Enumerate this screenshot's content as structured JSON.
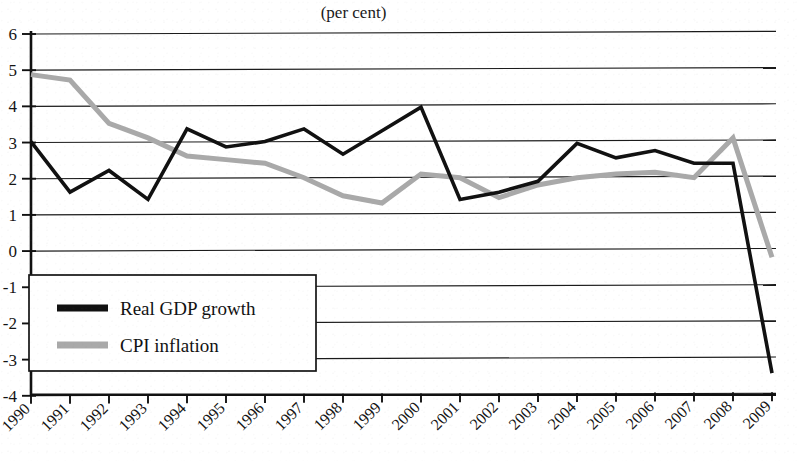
{
  "chart_data": {
    "type": "line",
    "title": "",
    "subtitle": "(per cent)",
    "xlabel": "",
    "ylabel": "",
    "unit": "per cent",
    "categories": [
      "1990",
      "1991",
      "1992",
      "1993",
      "1994",
      "1995",
      "1996",
      "1997",
      "1998",
      "1999",
      "2000",
      "2001",
      "2002",
      "2003",
      "2004",
      "2005",
      "2006",
      "2007",
      "2008",
      "2009"
    ],
    "x": [
      1990,
      1991,
      1992,
      1993,
      1994,
      1995,
      1996,
      1997,
      1998,
      1999,
      2000,
      2001,
      2002,
      2003,
      2004,
      2005,
      2006,
      2007,
      2008,
      2009
    ],
    "series": [
      {
        "name": "Real GDP growth",
        "color": "#111111",
        "values": [
          3.0,
          1.6,
          2.2,
          1.4,
          3.35,
          2.85,
          3.0,
          3.35,
          2.65,
          3.3,
          3.95,
          1.4,
          1.6,
          1.9,
          2.95,
          2.55,
          2.75,
          2.4,
          2.4,
          -3.4
        ]
      },
      {
        "name": "CPI inflation",
        "color": "#a9a9a9",
        "values": [
          4.85,
          4.7,
          3.5,
          3.1,
          2.6,
          2.5,
          2.4,
          2.0,
          1.5,
          1.3,
          2.1,
          2.0,
          1.45,
          1.8,
          2.0,
          2.1,
          2.15,
          2.0,
          3.1,
          -0.2
        ]
      }
    ],
    "ylim": [
      -4,
      6
    ],
    "ytick_step": 1,
    "ytick_labels": [
      "6",
      "5",
      "4",
      "3",
      "2",
      "1",
      "0",
      "-1",
      "-2",
      "-3",
      "-4"
    ],
    "ytick_values": [
      6,
      5,
      4,
      3,
      2,
      1,
      0,
      -1,
      -2,
      -3,
      -4
    ],
    "grid": true,
    "grid_axis": "y",
    "legend_position": "lower-left",
    "xtick_rotation": -45
  },
  "legend": {
    "items": [
      {
        "label": "Real GDP growth",
        "color": "#111111"
      },
      {
        "label": "CPI inflation",
        "color": "#a9a9a9"
      }
    ]
  },
  "colors": {
    "gdp": "#111111",
    "cpi": "#a9a9a9",
    "axis": "#111111",
    "grid": "#1b1b1b",
    "background": "#ffffff"
  }
}
